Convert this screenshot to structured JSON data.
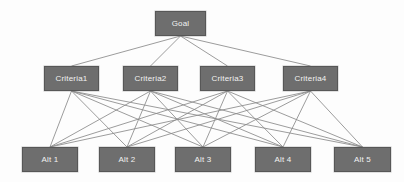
{
  "diagram": {
    "type": "ahp-hierarchy",
    "background_color": "#fdfdfd",
    "node_fill_color": "#6e6e6e",
    "node_border_color": "#575757",
    "node_text_color": "#f2f2f2",
    "edge_color": "#8a8a8a",
    "levels": [
      {
        "name": "goal",
        "nodes": [
          {
            "id": "goal",
            "label": "Goal",
            "x": 155,
            "y": 11,
            "w": 51,
            "h": 25
          }
        ]
      },
      {
        "name": "criteria",
        "nodes": [
          {
            "id": "c1",
            "label": "Criteria1",
            "x": 44,
            "y": 66,
            "w": 55,
            "h": 25
          },
          {
            "id": "c2",
            "label": "Criteria2",
            "x": 123,
            "y": 66,
            "w": 55,
            "h": 25
          },
          {
            "id": "c3",
            "label": "Criteria3",
            "x": 200,
            "y": 66,
            "w": 55,
            "h": 25
          },
          {
            "id": "c4",
            "label": "Criteria4",
            "x": 283,
            "y": 66,
            "w": 55,
            "h": 25
          }
        ]
      },
      {
        "name": "alternatives",
        "nodes": [
          {
            "id": "a1",
            "label": "Alt 1",
            "x": 22,
            "y": 147,
            "w": 56,
            "h": 25
          },
          {
            "id": "a2",
            "label": "Alt 2",
            "x": 99,
            "y": 147,
            "w": 56,
            "h": 25
          },
          {
            "id": "a3",
            "label": "Alt 3",
            "x": 175,
            "y": 147,
            "w": 56,
            "h": 25
          },
          {
            "id": "a4",
            "label": "Alt 4",
            "x": 255,
            "y": 147,
            "w": 56,
            "h": 25
          },
          {
            "id": "a5",
            "label": "Alt 5",
            "x": 334,
            "y": 147,
            "w": 57,
            "h": 25
          }
        ]
      }
    ],
    "edges": [
      {
        "from": "goal",
        "to": "c1"
      },
      {
        "from": "goal",
        "to": "c2"
      },
      {
        "from": "goal",
        "to": "c3"
      },
      {
        "from": "goal",
        "to": "c4"
      },
      {
        "from": "c1",
        "to": "a1"
      },
      {
        "from": "c1",
        "to": "a2"
      },
      {
        "from": "c1",
        "to": "a3"
      },
      {
        "from": "c1",
        "to": "a4"
      },
      {
        "from": "c1",
        "to": "a5"
      },
      {
        "from": "c2",
        "to": "a1"
      },
      {
        "from": "c2",
        "to": "a2"
      },
      {
        "from": "c2",
        "to": "a3"
      },
      {
        "from": "c2",
        "to": "a4"
      },
      {
        "from": "c2",
        "to": "a5"
      },
      {
        "from": "c3",
        "to": "a1"
      },
      {
        "from": "c3",
        "to": "a2"
      },
      {
        "from": "c3",
        "to": "a3"
      },
      {
        "from": "c3",
        "to": "a4"
      },
      {
        "from": "c3",
        "to": "a5"
      },
      {
        "from": "c4",
        "to": "a1"
      },
      {
        "from": "c4",
        "to": "a2"
      },
      {
        "from": "c4",
        "to": "a3"
      },
      {
        "from": "c4",
        "to": "a4"
      },
      {
        "from": "c4",
        "to": "a5"
      }
    ]
  }
}
